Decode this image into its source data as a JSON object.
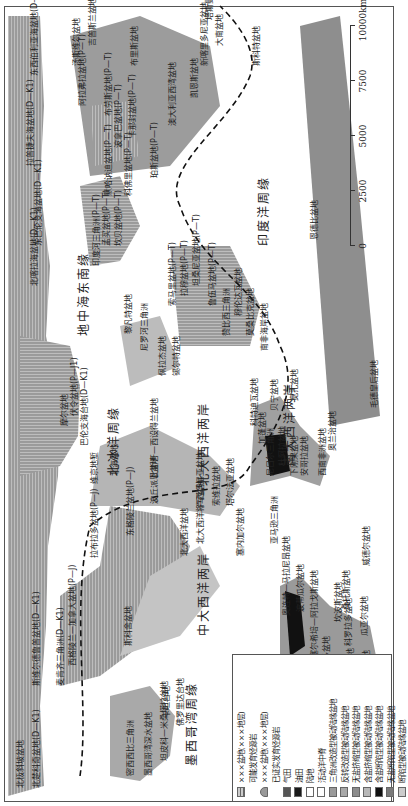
{
  "map": {
    "orientation": "rotated-90-ccw",
    "margins": {
      "arctic": "北冰洋周缘",
      "central_atlantic": "中大西洋两岸",
      "north_atlantic": "北大西洋两岸",
      "south_atlantic": "南大西洋两岸",
      "gulf_of_mexico": "墨西哥湾周缘",
      "mediterranean": "地中海东南缘",
      "indian_ocean": "印度洋周缘",
      "eastern_barents": "东巴伦支海盆地(D—K1)"
    },
    "basins": [
      {
        "name": "北极斜坡盆地",
        "x": 18,
        "y": 16
      },
      {
        "name": "北楚科奇盆地(D—K1)",
        "x": 18,
        "y": 32
      },
      {
        "name": "斯维尔德鲁普盆地(D—K1)",
        "x": 120,
        "y": 32
      },
      {
        "name": "麦肯齐三角洲(D—K1)",
        "x": 120,
        "y": 56
      },
      {
        "name": "西格陵兰—加拿大盆地(P—J)",
        "x": 140,
        "y": 68
      },
      {
        "name": "拉布拉多盆地(P—J)",
        "x": 248,
        "y": 90
      },
      {
        "name": "东格陵兰盆地(P—J)",
        "x": 270,
        "y": 126
      },
      {
        "name": "北大西洋盆地",
        "x": 250,
        "y": 180
      },
      {
        "name": "北大西洋将军盆地",
        "x": 262,
        "y": 196
      },
      {
        "name": "斯科舍盆地",
        "x": 160,
        "y": 124
      },
      {
        "name": "密西西比三角洲",
        "x": 30,
        "y": 126
      },
      {
        "name": "墨西哥湾深水盆地",
        "x": 30,
        "y": 144
      },
      {
        "name": "坦皮科—米桑塔拉盆地",
        "x": 45,
        "y": 160
      },
      {
        "name": "卡坦台地",
        "x": 88,
        "y": 162
      },
      {
        "name": "佛罗里达台地",
        "x": 80,
        "y": 176
      },
      {
        "name": "巴伦支海台地(D—K1)",
        "x": 360,
        "y": 80
      },
      {
        "name": "伏令盆地(P—J1)",
        "x": 390,
        "y": 70
      },
      {
        "name": "摩尔盆地",
        "x": 380,
        "y": 60
      },
      {
        "name": "维京地堑",
        "x": 322,
        "y": 90
      },
      {
        "name": "北海盆地",
        "x": 330,
        "y": 110
      },
      {
        "name": "比斯开—西设得兰盆地",
        "x": 328,
        "y": 150
      },
      {
        "name": "波丘派恩盆地",
        "x": 302,
        "y": 150
      },
      {
        "name": "卢西塔尼亚盆地",
        "x": 298,
        "y": 196
      },
      {
        "name": "索维拉盆地",
        "x": 300,
        "y": 212
      },
      {
        "name": "塔尔法亚盆地",
        "x": 300,
        "y": 226
      },
      {
        "name": "塞内加尔盆地",
        "x": 250,
        "y": 236
      },
      {
        "name": "亚马逊三角洲",
        "x": 262,
        "y": 270
      },
      {
        "name": "奥连特—马拉尼昂盆地",
        "x": 190,
        "y": 282
      },
      {
        "name": "波蒂瓜尔盆地",
        "x": 194,
        "y": 296
      },
      {
        "name": "塞尔希培—阿拉戈斯盆地",
        "x": 148,
        "y": 310
      },
      {
        "name": "萨拉多盆地",
        "x": 130,
        "y": 322
      },
      {
        "name": "坎波斯盆地",
        "x": 184,
        "y": 334
      },
      {
        "name": "桑托斯盆地",
        "x": 196,
        "y": 342
      },
      {
        "name": "科罗拉多盆地",
        "x": 160,
        "y": 344
      },
      {
        "name": "圣豪尔赫盆地",
        "x": 110,
        "y": 346
      },
      {
        "name": "马尔维纳斯盆地",
        "x": 100,
        "y": 362
      },
      {
        "name": "瓜亚尔盆地",
        "x": 170,
        "y": 360
      },
      {
        "name": "威德尔盆地",
        "x": 240,
        "y": 362
      },
      {
        "name": "尼日尔三角洲",
        "x": 330,
        "y": 266
      },
      {
        "name": "杜阿拉盆地",
        "x": 340,
        "y": 278
      },
      {
        "name": "下刚果盆地",
        "x": 330,
        "y": 290
      },
      {
        "name": "加蓬盆地",
        "x": 362,
        "y": 258
      },
      {
        "name": "贝宁盆地",
        "x": 395,
        "y": 270
      },
      {
        "name": "科特迪瓦盆地",
        "x": 380,
        "y": 250
      },
      {
        "name": "安哥拉盆地",
        "x": 330,
        "y": 300
      },
      {
        "name": "宽扎盆地",
        "x": 405,
        "y": 290
      },
      {
        "name": "西南非洲盆地",
        "x": 330,
        "y": 318
      },
      {
        "name": "奥兰治盆地",
        "x": 355,
        "y": 328
      },
      {
        "name": "毛德皇后盆地",
        "x": 398,
        "y": 370
      },
      {
        "name": "尼罗河三角洲",
        "x": 455,
        "y": 140
      },
      {
        "name": "黎凡特盆地",
        "x": 472,
        "y": 124
      },
      {
        "name": "佩拉杰盆地",
        "x": 430,
        "y": 158
      },
      {
        "name": "锡尔特盆地",
        "x": 430,
        "y": 172
      },
      {
        "name": "印度河三角洲(P—T)",
        "x": 540,
        "y": 92
      },
      {
        "name": "孟买盆地(P—T)",
        "x": 560,
        "y": 102
      },
      {
        "name": "坎贝盆地(P—T)",
        "x": 560,
        "y": 114
      },
      {
        "name": "默哈讷迪盆地(P—T)",
        "x": 610,
        "y": 104
      },
      {
        "name": "科佛里盆地(P—T)",
        "x": 610,
        "y": 124
      },
      {
        "name": "索马里盆地(P—T)",
        "x": 500,
        "y": 168
      },
      {
        "name": "拉穆盆地(P—T)",
        "x": 510,
        "y": 180
      },
      {
        "name": "坦桑尼亚盆地(P—T)",
        "x": 520,
        "y": 192
      },
      {
        "name": "鲁伍马盆地(P—T)",
        "x": 500,
        "y": 208
      },
      {
        "name": "赞比西三角洲",
        "x": 470,
        "y": 222
      },
      {
        "name": "穆伦达瓦盆地",
        "x": 490,
        "y": 234
      },
      {
        "name": "莫桑比克盆地",
        "x": 470,
        "y": 246
      },
      {
        "name": "南非海岸盆地",
        "x": 455,
        "y": 260
      },
      {
        "name": "恩德比盆地",
        "x": 566,
        "y": 310
      },
      {
        "name": "波拿巴盆地(P—T)",
        "x": 658,
        "y": 114
      },
      {
        "name": "卡那封盆地(P—T)",
        "x": 668,
        "y": 128
      },
      {
        "name": "布劳斯盆地(P—T)",
        "x": 690,
        "y": 104
      },
      {
        "name": "珀斯盆地(P—T)",
        "x": 628,
        "y": 150
      },
      {
        "name": "阿拉弗拉盆地(P—T)",
        "x": 700,
        "y": 78
      },
      {
        "name": "汤斯维尔盆地",
        "x": 740,
        "y": 72
      },
      {
        "name": "吉普斯兰盆地",
        "x": 760,
        "y": 88
      },
      {
        "name": "澳大利亚西湾盆地",
        "x": 680,
        "y": 168
      },
      {
        "name": "凯恩斯盆地",
        "x": 708,
        "y": 190
      },
      {
        "name": "新喀里多尼亚盆地",
        "x": 740,
        "y": 200
      },
      {
        "name": "大南盆地",
        "x": 760,
        "y": 215
      },
      {
        "name": "塔斯曼盆地",
        "x": 786,
        "y": 205
      },
      {
        "name": "布里斯盆地",
        "x": 740,
        "y": 130
      },
      {
        "name": "斯科特盆地",
        "x": 740,
        "y": 252
      },
      {
        "name": "拉普捷夫海盆地(D—K1)",
        "x": 640,
        "y": 26
      },
      {
        "name": "东西伯利亚海盆地(D—K1)",
        "x": 730,
        "y": 30
      },
      {
        "name": "北喀拉海盆地(D—K1)",
        "x": 520,
        "y": 30
      }
    ]
  },
  "legend": {
    "items": [
      {
        "label": "×××盆地(×××地层)",
        "swatch": "hatch-h"
      },
      {
        "label": "可能发育烃源岩",
        "swatch": "hatch-v"
      },
      {
        "label": "×××盆地(×××地层)",
        "swatch": "dome"
      },
      {
        "label": "已证实发育烃源岩",
        "swatch": "hatch-dense"
      },
      {
        "label": "气田",
        "swatch": "#555555"
      },
      {
        "label": "油田",
        "swatch": "#1a1a1a"
      },
      {
        "label": "陆地",
        "swatch": "#ffffff"
      },
      {
        "label": "活动洋中脊",
        "swatch": "line"
      },
      {
        "label": "三角洲改造型被动陆缘盆地",
        "swatch": "#9a9a9a"
      },
      {
        "label": "反转改造型被动陆缘盆地",
        "swatch": "#a8a8a8"
      },
      {
        "label": "无盐挤缩型被动陆缘盆地",
        "swatch": "#8c8c8c"
      },
      {
        "label": "含盐挤缩型被动陆缘盆地",
        "swatch": "#b8b8b8"
      },
      {
        "label": "含盐断陷型被动陆缘盆地",
        "swatch": "#111111"
      },
      {
        "label": "无盐断陷型被动陆缘盆地",
        "swatch": "#7a7a7a"
      },
      {
        "label": "断陷型被动陆缘盆地",
        "swatch": "#cccccc"
      }
    ]
  },
  "scale_bar": {
    "ticks": [
      "0",
      "2500",
      "5000",
      "7500",
      "10000km"
    ]
  },
  "colors": {
    "basin_gray": "#9a9a9a",
    "basin_light": "#c4c4c4",
    "oil_black": "#111111",
    "ridge_dash": "#111111"
  }
}
